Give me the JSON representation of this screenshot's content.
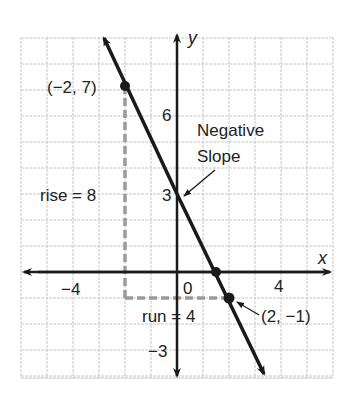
{
  "chart_data": {
    "type": "line",
    "title": "",
    "xlabel": "x",
    "ylabel": "y",
    "xlim": [
      -6,
      6
    ],
    "ylim": [
      -4,
      9
    ],
    "grid": true,
    "x_tick_labels": [
      {
        "value": -4,
        "label": "−4"
      },
      {
        "value": 0,
        "label": "0"
      },
      {
        "value": 4,
        "label": "4"
      }
    ],
    "y_tick_labels": [
      {
        "value": 6,
        "label": "6"
      },
      {
        "value": 3,
        "label": "3"
      },
      {
        "value": -3,
        "label": "−3"
      }
    ],
    "series": [
      {
        "name": "line",
        "equation": "y = -2x + 3",
        "slope": -2,
        "intercept": 3,
        "x": [
          -3.2,
          3.4
        ],
        "y": [
          9.4,
          -3.8
        ]
      }
    ],
    "points": [
      {
        "x": -2,
        "y": 7,
        "label": "(−2, 7)"
      },
      {
        "x": 2,
        "y": -1,
        "label": "(2, −1)"
      },
      {
        "x": 1.5,
        "y": 0,
        "label": ""
      }
    ],
    "annotations": [
      {
        "text": "Negative",
        "line2": "Slope",
        "arrow_to": [
          0,
          3
        ]
      },
      {
        "text": "rise = 8"
      },
      {
        "text": "run = 4"
      }
    ]
  },
  "labels": {
    "x_axis": "x",
    "y_axis": "y",
    "tick_neg4": "−4",
    "tick_0": "0",
    "tick_4": "4",
    "tick_6": "6",
    "tick_3": "3",
    "tick_neg3": "−3",
    "point_a": "(−2, 7)",
    "point_b": "(2, −1)",
    "neg_line1": "Negative",
    "neg_line2": "Slope",
    "rise": "rise = 8",
    "run": "run = 4"
  },
  "colors": {
    "grid": "#c8c8c8",
    "axis": "#1a1a1a",
    "line": "#1a1a1a",
    "dashed": "#9a9a9a"
  }
}
